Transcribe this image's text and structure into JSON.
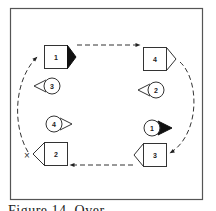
{
  "diagram": {
    "boxes": [
      {
        "label": "1",
        "pointer": "filled",
        "direction": "right"
      },
      {
        "label": "4",
        "pointer": "open",
        "direction": "right"
      },
      {
        "label": "3",
        "pointer": "open",
        "direction": "left"
      },
      {
        "label": "2",
        "pointer": "open",
        "direction": "left"
      }
    ],
    "circles": [
      {
        "label": "3",
        "pointer": "open",
        "direction": "left"
      },
      {
        "label": "2",
        "pointer": "open",
        "direction": "left"
      },
      {
        "label": "4",
        "pointer": "open",
        "direction": "right"
      },
      {
        "label": "1",
        "pointer": "filled",
        "direction": "right"
      }
    ],
    "start_marker": "×",
    "path": "clockwise dashed arrows: box 1 → box 4 → box 3 → box 2 → box 1"
  },
  "caption": "Figure 14. Over"
}
